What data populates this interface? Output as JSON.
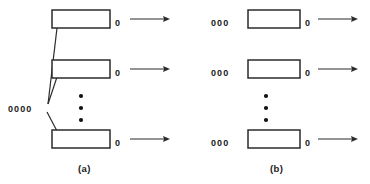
{
  "figure": {
    "background_color": "#ffffff",
    "ink_color": "#2b2b2b",
    "width": 370,
    "height": 184
  },
  "panels": [
    {
      "id": "a",
      "caption": "(a)",
      "caption_x": 88,
      "caption_y": 170,
      "queue_model": "single-shared-queue",
      "shared_queue": {
        "label": "0000",
        "customer_count": 4,
        "x": 8,
        "y": 108
      },
      "servers": [
        {
          "index": 1,
          "box_x": 52,
          "box_y": 10,
          "box_w": 58,
          "box_h": 18,
          "exit_label": "0",
          "exit_x": 118,
          "exit_y": 23,
          "arrow_x1": 130,
          "arrow_x2": 170,
          "arrow_y": 19
        },
        {
          "index": 2,
          "box_x": 52,
          "box_y": 60,
          "box_w": 58,
          "box_h": 18,
          "exit_label": "0",
          "exit_x": 118,
          "exit_y": 73,
          "arrow_x1": 130,
          "arrow_x2": 170,
          "arrow_y": 69
        },
        {
          "index": 3,
          "box_x": 52,
          "box_y": 130,
          "box_w": 58,
          "box_h": 18,
          "exit_label": "0",
          "exit_x": 118,
          "exit_y": 143,
          "arrow_x1": 130,
          "arrow_x2": 170,
          "arrow_y": 139
        }
      ],
      "connectors": [
        {
          "from_x": 47,
          "from_y": 103,
          "to_x": 56,
          "to_y": 27
        },
        {
          "from_x": 47,
          "from_y": 103,
          "to_x": 56,
          "to_y": 76
        },
        {
          "from_x": 46,
          "from_y": 110,
          "to_x": 56,
          "to_y": 131
        }
      ],
      "ellipsis": {
        "x": 80,
        "dots_y": [
          96,
          108,
          120
        ],
        "count": 3
      }
    },
    {
      "id": "b",
      "caption": "(b)",
      "caption_x": 280,
      "caption_y": 170,
      "queue_model": "separate-queue-per-server",
      "servers": [
        {
          "index": 1,
          "queue_label": "000",
          "queue_x": 210,
          "queue_y": 23,
          "customer_count": 3,
          "box_x": 248,
          "box_y": 10,
          "box_w": 52,
          "box_h": 18,
          "exit_label": "0",
          "exit_x": 307,
          "exit_y": 23,
          "arrow_x1": 318,
          "arrow_x2": 358,
          "arrow_y": 19
        },
        {
          "index": 2,
          "queue_label": "000",
          "queue_x": 210,
          "queue_y": 73,
          "customer_count": 3,
          "box_x": 248,
          "box_y": 60,
          "box_w": 52,
          "box_h": 18,
          "exit_label": "0",
          "exit_x": 307,
          "exit_y": 73,
          "arrow_x1": 318,
          "arrow_x2": 358,
          "arrow_y": 69
        },
        {
          "index": 3,
          "queue_label": "000",
          "queue_x": 210,
          "queue_y": 143,
          "customer_count": 3,
          "box_x": 248,
          "box_y": 130,
          "box_w": 52,
          "box_h": 18,
          "exit_label": "0",
          "exit_x": 307,
          "exit_y": 143,
          "arrow_x1": 318,
          "arrow_x2": 358,
          "arrow_y": 139
        }
      ],
      "ellipsis": {
        "x": 265,
        "dots_y": [
          96,
          108,
          120
        ],
        "count": 3
      }
    }
  ],
  "labels": {
    "panel_a_caption": "(a)",
    "panel_b_caption": "(b)",
    "shared_queue_a": "0000",
    "queue_b_row1": "000",
    "queue_b_row2": "000",
    "queue_b_row3": "000",
    "exit_a_row1": "0",
    "exit_a_row2": "0",
    "exit_a_row3": "0",
    "exit_b_row1": "0",
    "exit_b_row2": "0",
    "exit_b_row3": "0"
  }
}
